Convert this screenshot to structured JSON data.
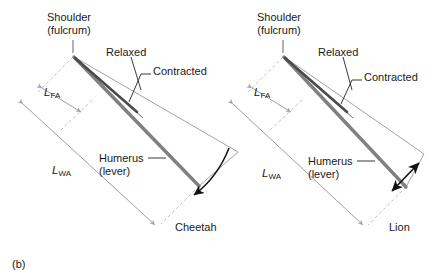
{
  "figure": {
    "panel_label": "(b)",
    "background_color": "#ffffff",
    "line_color_humerus": "#808080",
    "line_color_muscle": "#4d4d4d",
    "line_color_thin": "#8c8c8c",
    "line_color_dashed": "#b3b3b3",
    "text_color": "#1a1a1a"
  },
  "panels": [
    {
      "id": "cheetah",
      "animal_label": "Cheetah",
      "labels": {
        "fulcrum_line1": "Shoulder",
        "fulcrum_line2": "(fulcrum)",
        "relaxed": "Relaxed",
        "contracted": "Contracted",
        "humerus_line1": "Humerus",
        "humerus_line2": "(lever)",
        "l_fa": "L",
        "l_fa_sub": "FA",
        "l_wa": "L",
        "l_wa_sub": "WA"
      },
      "geometry": {
        "fulcrum": [
          73,
          56
        ],
        "humerus_end": [
          198,
          185
        ],
        "in_lever_end": [
          91,
          100
        ],
        "out_arrow_tip": [
          193,
          197
        ]
      }
    },
    {
      "id": "lion",
      "animal_label": "Lion",
      "labels": {
        "fulcrum_line1": "Shoulder",
        "fulcrum_line2": "(fulcrum)",
        "relaxed": "Relaxed",
        "contracted": "Contracted",
        "humerus_line1": "Humerus",
        "humerus_line2": "(lever)",
        "l_fa": "L",
        "l_fa_sub": "FA",
        "l_wa": "L",
        "l_wa_sub": "WA"
      },
      "geometry": {
        "fulcrum": [
          283,
          56
        ],
        "humerus_end": [
          406,
          186
        ],
        "in_lever_end": [
          301,
          100
        ],
        "out_arrow_tip": [
          404,
          169
        ]
      }
    }
  ]
}
